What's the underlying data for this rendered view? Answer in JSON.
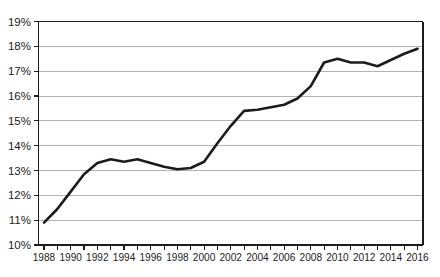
{
  "figure": {
    "background_color": "#ffffff"
  },
  "chart_data": {
    "type": "line",
    "title": "",
    "xlabel": "",
    "ylabel": "",
    "grid": "horizontal",
    "legend": "none",
    "frame": "full-box",
    "line_color": "#1c1c1c",
    "grid_color": "#b3b3b3",
    "axis_color": "#1c1c1c",
    "ylim": [
      10,
      19
    ],
    "y_tick_values": [
      10,
      11,
      12,
      13,
      14,
      15,
      16,
      17,
      18,
      19
    ],
    "y_tick_labels": [
      "10%",
      "11%",
      "12%",
      "13%",
      "14%",
      "15%",
      "16%",
      "17%",
      "18%",
      "19%"
    ],
    "x_minor_tick_step": 1,
    "x_tick_label_values": [
      1988,
      1990,
      1992,
      1994,
      1996,
      1998,
      2000,
      2002,
      2004,
      2006,
      2008,
      2010,
      2012,
      2014,
      2016
    ],
    "x_tick_labels": [
      "1988",
      "1990",
      "1992",
      "1994",
      "1996",
      "1998",
      "2000",
      "2002",
      "2004",
      "2006",
      "2008",
      "2010",
      "2012",
      "2014",
      "2016"
    ],
    "x": [
      1988,
      1989,
      1990,
      1991,
      1992,
      1993,
      1994,
      1995,
      1996,
      1997,
      1998,
      1999,
      2000,
      2001,
      2002,
      2003,
      2004,
      2005,
      2006,
      2007,
      2008,
      2009,
      2010,
      2011,
      2012,
      2013,
      2014,
      2015,
      2016
    ],
    "series": [
      {
        "name": "percentage-series",
        "values": [
          10.9,
          11.45,
          12.15,
          12.85,
          13.3,
          13.45,
          13.35,
          13.45,
          13.3,
          13.15,
          13.05,
          13.1,
          13.35,
          14.1,
          14.8,
          15.4,
          15.45,
          15.55,
          15.65,
          15.9,
          16.4,
          17.35,
          17.5,
          17.35,
          17.35,
          17.2,
          17.45,
          17.7,
          17.9
        ]
      }
    ]
  }
}
